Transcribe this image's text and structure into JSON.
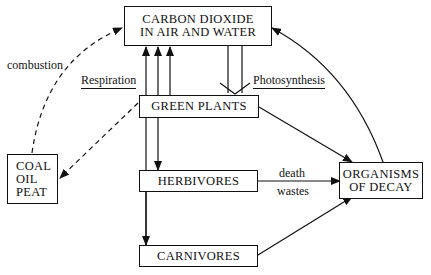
{
  "diagram": {
    "nodes": {
      "co2": {
        "line1": "CARBON DIOXIDE",
        "line2": "IN AIR AND WATER"
      },
      "plants": {
        "label": "GREEN PLANTS"
      },
      "herbivores": {
        "label": "HERBIVORES"
      },
      "carnivores": {
        "label": "CARNIVORES"
      },
      "fossil": {
        "line1": "COAL",
        "line2": "OIL",
        "line3": "PEAT"
      },
      "decay": {
        "line1": "ORGANISMS",
        "line2": "OF DECAY"
      }
    },
    "labels": {
      "combustion": "combustion",
      "respiration": "Respiration",
      "photosynthesis": "Photosynthesis",
      "death": "death",
      "wastes": "wastes"
    },
    "edges": [
      {
        "from": "fossil",
        "to": "co2",
        "label": "combustion",
        "style": "dashed"
      },
      {
        "from": "plants",
        "to": "fossil",
        "style": "dashed"
      },
      {
        "from": "plants",
        "to": "co2",
        "label": "Respiration"
      },
      {
        "from": "herbivores",
        "to": "co2",
        "label": "Respiration"
      },
      {
        "from": "carnivores",
        "to": "co2",
        "label": "Respiration"
      },
      {
        "from": "co2",
        "to": "plants",
        "label": "Photosynthesis"
      },
      {
        "from": "plants",
        "to": "herbivores"
      },
      {
        "from": "herbivores",
        "to": "carnivores"
      },
      {
        "from": "plants",
        "to": "decay"
      },
      {
        "from": "herbivores",
        "to": "decay",
        "label": "death / wastes"
      },
      {
        "from": "carnivores",
        "to": "decay"
      },
      {
        "from": "decay",
        "to": "co2"
      }
    ]
  }
}
